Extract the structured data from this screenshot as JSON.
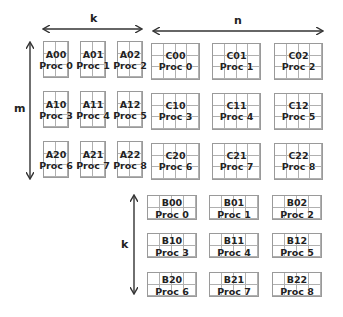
{
  "colors": {
    "grid_line": "#9a9a9a",
    "text": "#222222",
    "arrow": "#333333",
    "background": "#ffffff"
  },
  "dimensions": {
    "k_top": {
      "label": "k"
    },
    "n_top": {
      "label": "n"
    },
    "m_left": {
      "label": "m"
    },
    "k_left": {
      "label": "k"
    }
  },
  "matrix_A": {
    "grid": {
      "cols": 2,
      "rows": 3
    },
    "blocks": [
      [
        {
          "name": "A00",
          "proc": "Proc 0"
        },
        {
          "name": "A01",
          "proc": "Proc 1"
        },
        {
          "name": "A02",
          "proc": "Proc 2"
        }
      ],
      [
        {
          "name": "A10",
          "proc": "Proc 3"
        },
        {
          "name": "A11",
          "proc": "Proc 4"
        },
        {
          "name": "A12",
          "proc": "Proc 5"
        }
      ],
      [
        {
          "name": "A20",
          "proc": "Proc 6"
        },
        {
          "name": "A21",
          "proc": "Proc 7"
        },
        {
          "name": "A22",
          "proc": "Proc 8"
        }
      ]
    ]
  },
  "matrix_C": {
    "grid": {
      "cols": 4,
      "rows": 3
    },
    "blocks": [
      [
        {
          "name": "C00",
          "proc": "Proc 0"
        },
        {
          "name": "C01",
          "proc": "Proc 1"
        },
        {
          "name": "C02",
          "proc": "Proc 2"
        }
      ],
      [
        {
          "name": "C10",
          "proc": "Proc 3"
        },
        {
          "name": "C11",
          "proc": "Proc 4"
        },
        {
          "name": "C12",
          "proc": "Proc 5"
        }
      ],
      [
        {
          "name": "C20",
          "proc": "Proc 6"
        },
        {
          "name": "C21",
          "proc": "Proc 7"
        },
        {
          "name": "C22",
          "proc": "Proc 8"
        }
      ]
    ]
  },
  "matrix_B": {
    "grid": {
      "cols": 4,
      "rows": 2
    },
    "blocks": [
      [
        {
          "name": "B00",
          "proc": "Proc 0"
        },
        {
          "name": "B01",
          "proc": "Proc 1"
        },
        {
          "name": "B02",
          "proc": "Proc 2"
        }
      ],
      [
        {
          "name": "B10",
          "proc": "Proc 3"
        },
        {
          "name": "B11",
          "proc": "Proc 4"
        },
        {
          "name": "B12",
          "proc": "Proc 5"
        }
      ],
      [
        {
          "name": "B20",
          "proc": "Proc 6"
        },
        {
          "name": "B21",
          "proc": "Proc 7"
        },
        {
          "name": "B22",
          "proc": "Proc 8"
        }
      ]
    ]
  }
}
